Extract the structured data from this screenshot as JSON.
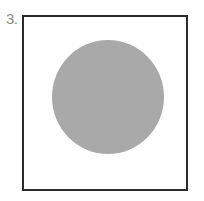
{
  "problem": {
    "number_label": "3."
  },
  "figure": {
    "frame": {
      "border_color": "#2b2b2b",
      "fill": "#ffffff"
    },
    "circle": {
      "cx": 108,
      "cy": 97,
      "rx": 56,
      "ry": 57,
      "fill": "#a9a9a9"
    }
  }
}
